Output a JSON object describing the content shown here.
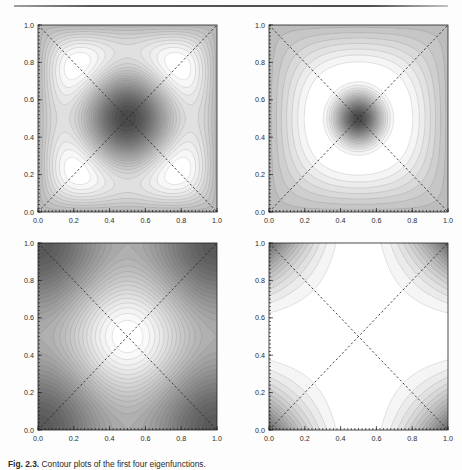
{
  "page": {
    "rule_present": true,
    "background_color": "#fdfdfd",
    "ink_color": "#1a1a1a"
  },
  "caption": {
    "label": "Fig. 2.3.",
    "body": "Contour plots of the first four eigenfunctions."
  },
  "chart_data": [
    {
      "type": "heatmap",
      "panel_index": 0,
      "panel_name": "top-left",
      "title": "",
      "xlabel": "",
      "ylabel": "",
      "xlim": [
        0.0,
        1.0
      ],
      "ylim": [
        0.0,
        1.0
      ],
      "xticks": [
        "0.0",
        "0.2",
        "0.4",
        "0.6",
        "0.8",
        "1.0"
      ],
      "yticks": [
        "0.0",
        "0.2",
        "0.4",
        "0.6",
        "0.8",
        "1.0"
      ],
      "xtick_values": [
        0.0,
        0.2,
        0.4,
        0.6,
        0.8,
        1.0
      ],
      "ytick_values": [
        0.0,
        0.2,
        0.4,
        0.6,
        0.8,
        1.0
      ],
      "grid": false,
      "legend": "none",
      "colormap": "grayscale",
      "colormap_low": "#4a4a4a",
      "colormap_high": "#ffffff",
      "contour_levels": 24,
      "field": "sin(pi*x)*sin(pi*y)*(cos(2*pi*x)+cos(2*pi*y))",
      "annotations": [
        {
          "kind": "dashed-diagonal",
          "from": [
            0.0,
            0.0
          ],
          "to": [
            1.0,
            1.0
          ]
        },
        {
          "kind": "dashed-diagonal",
          "from": [
            0.0,
            1.0
          ],
          "to": [
            1.0,
            0.0
          ]
        }
      ],
      "features": [
        {
          "kind": "dark-lobe",
          "center": [
            0.5,
            0.76
          ]
        },
        {
          "kind": "dark-lobe",
          "center": [
            0.5,
            0.24
          ]
        },
        {
          "kind": "dark-lobe",
          "center": [
            0.24,
            0.5
          ]
        },
        {
          "kind": "dark-lobe",
          "center": [
            0.76,
            0.5
          ]
        },
        {
          "kind": "light-center",
          "center": [
            0.5,
            0.5
          ]
        }
      ]
    },
    {
      "type": "heatmap",
      "panel_index": 1,
      "panel_name": "top-right",
      "title": "",
      "xlabel": "",
      "ylabel": "",
      "xlim": [
        0.0,
        1.0
      ],
      "ylim": [
        0.0,
        1.0
      ],
      "xticks": [
        "0.0",
        "0.2",
        "0.4",
        "0.6",
        "0.8",
        "1.0"
      ],
      "yticks": [
        "0.0",
        "0.2",
        "0.4",
        "0.6",
        "0.8",
        "1.0"
      ],
      "xtick_values": [
        0.0,
        0.2,
        0.4,
        0.6,
        0.8,
        1.0
      ],
      "ytick_values": [
        0.0,
        0.2,
        0.4,
        0.6,
        0.8,
        1.0
      ],
      "grid": false,
      "legend": "none",
      "colormap": "grayscale",
      "colormap_low": "#4a4a4a",
      "colormap_high": "#ffffff",
      "contour_levels": 20,
      "field": "crescent-quadrupole",
      "annotations": [
        {
          "kind": "dashed-diagonal",
          "from": [
            0.0,
            0.0
          ],
          "to": [
            1.0,
            1.0
          ]
        },
        {
          "kind": "dashed-diagonal",
          "from": [
            0.0,
            1.0
          ],
          "to": [
            1.0,
            0.0
          ]
        }
      ],
      "features": [
        {
          "kind": "dark-crescent",
          "center": [
            0.5,
            0.8
          ]
        },
        {
          "kind": "dark-crescent",
          "center": [
            0.5,
            0.2
          ]
        },
        {
          "kind": "dark-crescent",
          "center": [
            0.2,
            0.5
          ]
        },
        {
          "kind": "dark-crescent",
          "center": [
            0.8,
            0.5
          ]
        },
        {
          "kind": "light-center",
          "center": [
            0.5,
            0.5
          ]
        }
      ]
    },
    {
      "type": "heatmap",
      "panel_index": 2,
      "panel_name": "bottom-left",
      "title": "",
      "xlabel": "",
      "ylabel": "",
      "xlim": [
        0.0,
        1.0
      ],
      "ylim": [
        0.0,
        1.0
      ],
      "xticks": [
        "0.0",
        "0.2",
        "0.4",
        "0.6",
        "0.8",
        "1.0"
      ],
      "yticks": [
        "0.0",
        "0.2",
        "0.4",
        "0.6",
        "0.8",
        "1.0"
      ],
      "xtick_values": [
        0.0,
        0.2,
        0.4,
        0.6,
        0.8,
        1.0
      ],
      "ytick_values": [
        0.0,
        0.2,
        0.4,
        0.6,
        0.8,
        1.0
      ],
      "grid": false,
      "legend": "none",
      "colormap": "grayscale",
      "colormap_low": "#5a5a5a",
      "colormap_high": "#ffffff",
      "contour_levels": 28,
      "field": "cos(2*pi*x)+cos(2*pi*y) peaks at centre and edge-midpoints",
      "annotations": [
        {
          "kind": "dashed-diagonal",
          "from": [
            0.0,
            0.0
          ],
          "to": [
            1.0,
            1.0
          ]
        },
        {
          "kind": "dashed-diagonal",
          "from": [
            0.0,
            1.0
          ],
          "to": [
            1.0,
            0.0
          ]
        }
      ],
      "features": [
        {
          "kind": "bright-peak",
          "center": [
            0.5,
            0.5
          ]
        },
        {
          "kind": "bright-peak",
          "center": [
            0.5,
            1.0
          ]
        },
        {
          "kind": "bright-peak",
          "center": [
            0.5,
            0.0
          ]
        },
        {
          "kind": "bright-peak",
          "center": [
            0.0,
            0.5
          ]
        },
        {
          "kind": "bright-peak",
          "center": [
            1.0,
            0.5
          ]
        },
        {
          "kind": "dark-corner-lobe",
          "center": [
            0.14,
            0.86
          ]
        },
        {
          "kind": "dark-corner-lobe",
          "center": [
            0.86,
            0.86
          ]
        },
        {
          "kind": "dark-corner-lobe",
          "center": [
            0.14,
            0.14
          ]
        },
        {
          "kind": "dark-corner-lobe",
          "center": [
            0.86,
            0.14
          ]
        }
      ]
    },
    {
      "type": "heatmap",
      "panel_index": 3,
      "panel_name": "bottom-right",
      "title": "",
      "xlabel": "",
      "ylabel": "",
      "xlim": [
        0.0,
        1.0
      ],
      "ylim": [
        0.0,
        1.0
      ],
      "xticks": [
        "0.0",
        "0.2",
        "0.4",
        "0.6",
        "0.8",
        "1.0"
      ],
      "yticks": [
        "0.0",
        "0.2",
        "0.4",
        "0.6",
        "0.8",
        "1.0"
      ],
      "xtick_values": [
        0.0,
        0.2,
        0.4,
        0.6,
        0.8,
        1.0
      ],
      "ytick_values": [
        0.0,
        0.2,
        0.4,
        0.6,
        0.8,
        1.0
      ],
      "grid": false,
      "legend": "none",
      "colormap": "grayscale",
      "colormap_low": "#6a6a6a",
      "colormap_high": "#ffffff",
      "contour_levels": 16,
      "field": "hyperbolic saddle, dark at the four corners, bright cross-shaped interior",
      "annotations": [
        {
          "kind": "dashed-diagonal",
          "from": [
            0.0,
            0.0
          ],
          "to": [
            1.0,
            1.0
          ]
        },
        {
          "kind": "dashed-diagonal",
          "from": [
            0.0,
            1.0
          ],
          "to": [
            1.0,
            0.0
          ]
        }
      ],
      "features": [
        {
          "kind": "dark-corner",
          "center": [
            0.0,
            1.0
          ]
        },
        {
          "kind": "dark-corner",
          "center": [
            1.0,
            1.0
          ]
        },
        {
          "kind": "dark-corner",
          "center": [
            0.0,
            0.0
          ]
        },
        {
          "kind": "dark-corner",
          "center": [
            1.0,
            0.0
          ]
        },
        {
          "kind": "bright-cross",
          "center": [
            0.5,
            0.5
          ]
        }
      ]
    }
  ]
}
